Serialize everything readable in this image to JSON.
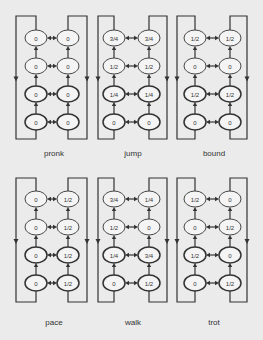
{
  "figure": {
    "colors": {
      "background": "#ebebeb",
      "line": "#333333",
      "node_fill": "#f4f4f4"
    },
    "panels": [
      {
        "name": "pronk",
        "rows": [
          [
            "0",
            "0"
          ],
          [
            "0",
            "0"
          ],
          [
            "0",
            "0"
          ],
          [
            "0",
            "0"
          ]
        ]
      },
      {
        "name": "jump",
        "rows": [
          [
            "3/4",
            "3/4"
          ],
          [
            "1/2",
            "1/2"
          ],
          [
            "1/4",
            "1/4"
          ],
          [
            "0",
            "0"
          ]
        ]
      },
      {
        "name": "bound",
        "rows": [
          [
            "1/2",
            "1/2"
          ],
          [
            "0",
            "0"
          ],
          [
            "1/2",
            "1/2"
          ],
          [
            "0",
            "0"
          ]
        ]
      },
      {
        "name": "pace",
        "rows": [
          [
            "0",
            "1/2"
          ],
          [
            "0",
            "1/2"
          ],
          [
            "0",
            "1/2"
          ],
          [
            "0",
            "1/2"
          ]
        ]
      },
      {
        "name": "walk",
        "rows": [
          [
            "3/4",
            "1/4"
          ],
          [
            "1/2",
            "0"
          ],
          [
            "1/4",
            "3/4"
          ],
          [
            "0",
            "1/2"
          ]
        ]
      },
      {
        "name": "trot",
        "rows": [
          [
            "1/2",
            "0"
          ],
          [
            "0",
            "1/2"
          ],
          [
            "1/2",
            "0"
          ],
          [
            "0",
            "1/2"
          ]
        ]
      }
    ]
  }
}
